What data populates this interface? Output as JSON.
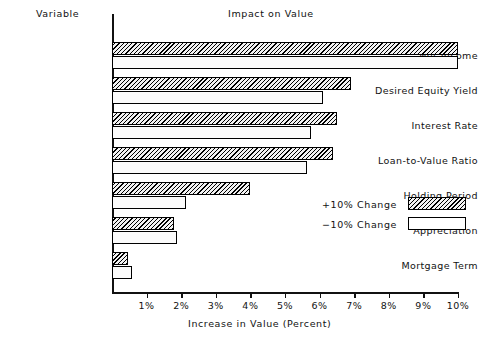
{
  "header": {
    "variable_column_label": "Variable",
    "title": "Impact on Value"
  },
  "axis": {
    "x_title": "Increase in Value (Percent)",
    "tick_labels": [
      "1%",
      "2%",
      "3%",
      "4%",
      "5%",
      "6%",
      "7%",
      "8%",
      "9%",
      "10%"
    ]
  },
  "legend": {
    "position": "inside-right",
    "entries": [
      {
        "label": "+10% Change",
        "pattern": "hatched"
      },
      {
        "label": "−10% Change",
        "pattern": "plain"
      }
    ]
  },
  "chart_data": {
    "type": "bar",
    "orientation": "horizontal",
    "title": "Impact on Value",
    "xlabel": "Increase in Value (Percent)",
    "ylabel": "Variable",
    "xlim": [
      0,
      10
    ],
    "grid": false,
    "categories": [
      "Net Income",
      "Desired Equity Yield",
      "Interest Rate",
      "Loan-to-Value Ratio",
      "Holding Period",
      "Appreciation",
      "Mortgage Term"
    ],
    "series": [
      {
        "name": "+10% Change",
        "pattern": "hatched",
        "values": [
          10.0,
          6.9,
          6.5,
          6.4,
          4.0,
          1.78,
          0.45
        ]
      },
      {
        "name": "−10% Change",
        "pattern": "plain",
        "values": [
          10.0,
          6.1,
          5.75,
          5.65,
          2.15,
          1.88,
          0.57
        ]
      }
    ]
  }
}
